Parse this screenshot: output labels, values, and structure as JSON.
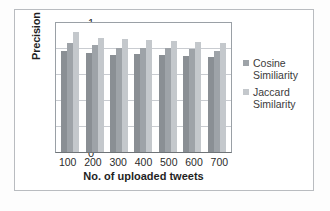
{
  "chart_data": {
    "type": "bar",
    "title": "",
    "xlabel": "No. of uploaded tweets",
    "ylabel": "Precision",
    "categories": [
      "100",
      "200",
      "300",
      "400",
      "500",
      "600",
      "700"
    ],
    "ylim": [
      0,
      1
    ],
    "yticks": [
      "0",
      "0.2",
      "0.4",
      "0.6",
      "0.8",
      "1"
    ],
    "grid": true,
    "legend_position": "right",
    "series": [
      {
        "name": "Series 1",
        "color": "#8a8f94",
        "values": [
          0.78,
          0.76,
          0.75,
          0.755,
          0.75,
          0.74,
          0.73
        ]
      },
      {
        "name": "Cosine Similiarity",
        "color": "#9ea3a8",
        "values": [
          0.84,
          0.82,
          0.8,
          0.8,
          0.8,
          0.79,
          0.78
        ]
      },
      {
        "name": "Jaccard Similarity",
        "color": "#c4c8cc",
        "values": [
          0.92,
          0.88,
          0.87,
          0.86,
          0.855,
          0.85,
          0.84
        ]
      }
    ]
  },
  "legend": {
    "entries": [
      {
        "line1": "Cosine",
        "line2": "Similiarity",
        "color": "#9ea3a8"
      },
      {
        "line1": "Jaccard",
        "line2": "Similarity",
        "color": "#c4c8cc"
      }
    ]
  }
}
